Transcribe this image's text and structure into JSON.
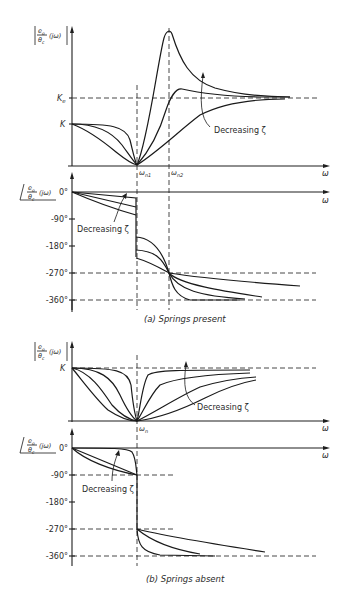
{
  "figure": {
    "panel_a": {
      "caption": "(a)  Springs present",
      "magnitude": {
        "ylabel_num": "e",
        "ylabel_num_sub": "o",
        "ylabel_den": "θ",
        "ylabel_den_sub": "c",
        "ylabel_arg": "(jω)",
        "tick_Ke": "K",
        "tick_Ke_sub": "e",
        "tick_K": "K",
        "xlabel": "ω",
        "omega_n1": "ω",
        "omega_n1_sub": "n1",
        "omega_n2": "ω",
        "omega_n2_sub": "n2",
        "annotation": "Decreasing ζ"
      },
      "phase": {
        "ylabel_num": "e",
        "ylabel_num_sub": "o",
        "ylabel_den": "θ",
        "ylabel_den_sub": "c",
        "ylabel_arg": "(jω)",
        "ticks": [
          "0°",
          "-90°",
          "-180°",
          "-270°",
          "-360°"
        ],
        "xlabel": "ω",
        "annotation": "Decreasing ζ"
      }
    },
    "panel_b": {
      "caption": "(b)  Springs absent",
      "magnitude": {
        "ylabel_num": "e",
        "ylabel_num_sub": "o",
        "ylabel_den": "θ",
        "ylabel_den_sub": "c",
        "ylabel_arg": "(jω)",
        "tick_K": "K",
        "xlabel": "ω",
        "omega_n": "ω",
        "omega_n_sub": "n",
        "annotation": "Decreasing ζ"
      },
      "phase": {
        "ylabel_num": "e",
        "ylabel_num_sub": "o",
        "ylabel_den": "θ",
        "ylabel_den_sub": "c",
        "ylabel_arg": "(jω)",
        "ticks": [
          "0°",
          "-90°",
          "-180°",
          "-270°",
          "-360°"
        ],
        "xlabel": "ω",
        "annotation": "Decreasing ζ"
      }
    }
  }
}
